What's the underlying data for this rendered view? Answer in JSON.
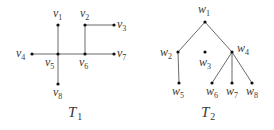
{
  "figure": {
    "width": 274,
    "height": 130,
    "background": "#ffffff",
    "edge_color": "#6a6a6a",
    "node_color": "#111111",
    "label_color": "#3a3a3a"
  },
  "graphs": [
    {
      "id": "T1",
      "title": {
        "letter": "T",
        "sub": "1",
        "x": 68,
        "y": 117
      },
      "nodes": [
        {
          "id": "v1",
          "letter": "v",
          "sub": "1",
          "x": 58,
          "y": 25,
          "lx": 53,
          "ly": 17
        },
        {
          "id": "v2",
          "letter": "v",
          "sub": "2",
          "x": 85,
          "y": 25,
          "lx": 80,
          "ly": 17
        },
        {
          "id": "v3",
          "letter": "v",
          "sub": "3",
          "x": 114,
          "y": 25,
          "lx": 117,
          "ly": 28
        },
        {
          "id": "v4",
          "letter": "v",
          "sub": "4",
          "x": 32,
          "y": 54,
          "lx": 16,
          "ly": 57
        },
        {
          "id": "v5",
          "letter": "v",
          "sub": "5",
          "x": 58,
          "y": 54,
          "lx": 45,
          "ly": 66
        },
        {
          "id": "v6",
          "letter": "v",
          "sub": "6",
          "x": 85,
          "y": 54,
          "lx": 79,
          "ly": 66
        },
        {
          "id": "v7",
          "letter": "v",
          "sub": "7",
          "x": 114,
          "y": 54,
          "lx": 117,
          "ly": 57
        },
        {
          "id": "v8",
          "letter": "v",
          "sub": "8",
          "x": 58,
          "y": 84,
          "lx": 53,
          "ly": 96
        }
      ],
      "edges": [
        [
          "v1",
          "v5"
        ],
        [
          "v4",
          "v5"
        ],
        [
          "v5",
          "v6"
        ],
        [
          "v6",
          "v7"
        ],
        [
          "v5",
          "v8"
        ],
        [
          "v2",
          "v6"
        ],
        [
          "v2",
          "v3"
        ]
      ]
    },
    {
      "id": "T2",
      "title": {
        "letter": "T",
        "sub": "2",
        "x": 201,
        "y": 117
      },
      "nodes": [
        {
          "id": "w1",
          "letter": "w",
          "sub": "1",
          "x": 205,
          "y": 22,
          "lx": 198,
          "ly": 13
        },
        {
          "id": "w2",
          "letter": "w",
          "sub": "2",
          "x": 178,
          "y": 52,
          "lx": 160,
          "ly": 56
        },
        {
          "id": "w3",
          "letter": "w",
          "sub": "3",
          "x": 205,
          "y": 52,
          "lx": 199,
          "ly": 66
        },
        {
          "id": "w4",
          "letter": "w",
          "sub": "4",
          "x": 232,
          "y": 52,
          "lx": 237,
          "ly": 52
        },
        {
          "id": "w5",
          "letter": "w",
          "sub": "5",
          "x": 179,
          "y": 83,
          "lx": 172,
          "ly": 95
        },
        {
          "id": "w6",
          "letter": "w",
          "sub": "6",
          "x": 212,
          "y": 83,
          "lx": 206,
          "ly": 95
        },
        {
          "id": "w7",
          "letter": "w",
          "sub": "7",
          "x": 232,
          "y": 83,
          "lx": 226,
          "ly": 95
        },
        {
          "id": "w8",
          "letter": "w",
          "sub": "8",
          "x": 252,
          "y": 83,
          "lx": 246,
          "ly": 95
        }
      ],
      "edges": [
        [
          "w1",
          "w2"
        ],
        [
          "w1",
          "w4"
        ],
        [
          "w2",
          "w5"
        ],
        [
          "w4",
          "w6"
        ],
        [
          "w4",
          "w7"
        ],
        [
          "w4",
          "w8"
        ]
      ]
    }
  ]
}
